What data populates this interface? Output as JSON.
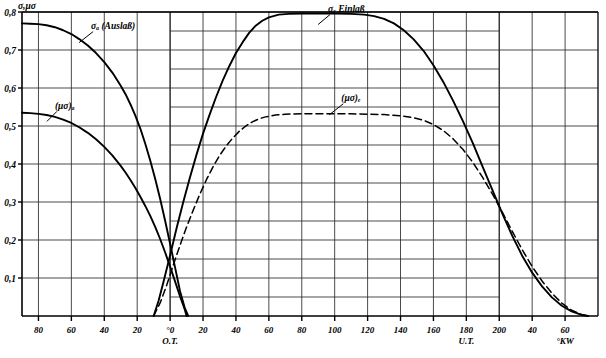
{
  "figure": {
    "y_axis_title": "σ,μσ",
    "x_unit_label": "°KW",
    "tdc_marker": "O.T.",
    "bdc_marker": "U.T."
  },
  "chart_data": {
    "type": "line",
    "title": "",
    "subtitle": "",
    "xlabel": "°KW",
    "ylabel": "σ,μσ",
    "grid": true,
    "legend_position": "inline-annotations",
    "xlim": [
      -90,
      260
    ],
    "ylim": [
      0,
      0.8
    ],
    "y_ticks": [
      0.1,
      0.2,
      0.3,
      0.4,
      0.5,
      0.6,
      0.7,
      0.8
    ],
    "y_tick_labels": [
      "0,1",
      "0,2",
      "0,3",
      "0,4",
      "0,5",
      "0,6",
      "0,7",
      "0,8"
    ],
    "x_ticks": [
      -80,
      -60,
      -40,
      -20,
      0,
      20,
      40,
      60,
      80,
      100,
      120,
      140,
      160,
      180,
      200,
      220,
      240
    ],
    "x_tick_labels": [
      "80",
      "60",
      "40",
      "20",
      "0",
      "20",
      "40",
      "60",
      "80",
      "100",
      "120",
      "140",
      "160",
      "180",
      "200",
      "40",
      "60"
    ],
    "x_tick_sublabels": {
      "0": "O.T.",
      "180": "U.T."
    },
    "annotations": [
      {
        "text": "σₐ (Auslaß)",
        "x": -48,
        "y": 0.755
      },
      {
        "text": "σₑ Einlaß",
        "x": 96,
        "y": 0.8
      },
      {
        "text": "(μσ)ₐ",
        "x": -70,
        "y": 0.545
      },
      {
        "text": "(μσ)ₑ",
        "x": 104,
        "y": 0.565
      }
    ],
    "series": [
      {
        "name": "σₐ (Auslaß)",
        "style": "solid",
        "points": [
          [
            -90,
            0.77
          ],
          [
            -85,
            0.769
          ],
          [
            -80,
            0.768
          ],
          [
            -75,
            0.765
          ],
          [
            -70,
            0.76
          ],
          [
            -65,
            0.752
          ],
          [
            -60,
            0.742
          ],
          [
            -55,
            0.728
          ],
          [
            -50,
            0.712
          ],
          [
            -45,
            0.692
          ],
          [
            -40,
            0.668
          ],
          [
            -35,
            0.64
          ],
          [
            -30,
            0.606
          ],
          [
            -27,
            0.583
          ],
          [
            -24,
            0.556
          ],
          [
            -21,
            0.526
          ],
          [
            -18,
            0.492
          ],
          [
            -15,
            0.452
          ],
          [
            -12,
            0.408
          ],
          [
            -9,
            0.36
          ],
          [
            -6,
            0.307
          ],
          [
            -3,
            0.25
          ],
          [
            0,
            0.19
          ],
          [
            3,
            0.128
          ],
          [
            6,
            0.066
          ],
          [
            9,
            0.02
          ],
          [
            11,
            0.0
          ]
        ]
      },
      {
        "name": "(μσ)ₐ",
        "style": "solid",
        "points": [
          [
            -90,
            0.535
          ],
          [
            -85,
            0.534
          ],
          [
            -80,
            0.532
          ],
          [
            -75,
            0.529
          ],
          [
            -70,
            0.524
          ],
          [
            -65,
            0.517
          ],
          [
            -60,
            0.508
          ],
          [
            -55,
            0.496
          ],
          [
            -50,
            0.482
          ],
          [
            -45,
            0.465
          ],
          [
            -40,
            0.445
          ],
          [
            -35,
            0.422
          ],
          [
            -30,
            0.395
          ],
          [
            -27,
            0.377
          ],
          [
            -24,
            0.357
          ],
          [
            -21,
            0.336
          ],
          [
            -18,
            0.313
          ],
          [
            -15,
            0.289
          ],
          [
            -12,
            0.263
          ],
          [
            -9,
            0.234
          ],
          [
            -6,
            0.202
          ],
          [
            -3,
            0.167
          ],
          [
            0,
            0.13
          ],
          [
            3,
            0.091
          ],
          [
            6,
            0.052
          ],
          [
            9,
            0.016
          ],
          [
            10,
            0.0
          ]
        ]
      },
      {
        "name": "σₑ Einlaß",
        "style": "solid",
        "points": [
          [
            -10,
            0.0
          ],
          [
            -7,
            0.04
          ],
          [
            -4,
            0.09
          ],
          [
            0,
            0.16
          ],
          [
            4,
            0.232
          ],
          [
            8,
            0.3
          ],
          [
            12,
            0.364
          ],
          [
            16,
            0.424
          ],
          [
            20,
            0.48
          ],
          [
            24,
            0.53
          ],
          [
            28,
            0.577
          ],
          [
            32,
            0.62
          ],
          [
            36,
            0.658
          ],
          [
            40,
            0.692
          ],
          [
            44,
            0.72
          ],
          [
            48,
            0.745
          ],
          [
            52,
            0.764
          ],
          [
            56,
            0.777
          ],
          [
            60,
            0.786
          ],
          [
            66,
            0.793
          ],
          [
            72,
            0.795
          ],
          [
            80,
            0.796
          ],
          [
            90,
            0.796
          ],
          [
            100,
            0.796
          ],
          [
            110,
            0.795
          ],
          [
            118,
            0.793
          ],
          [
            124,
            0.789
          ],
          [
            130,
            0.782
          ],
          [
            136,
            0.77
          ],
          [
            142,
            0.752
          ],
          [
            148,
            0.728
          ],
          [
            154,
            0.698
          ],
          [
            160,
            0.66
          ],
          [
            166,
            0.616
          ],
          [
            172,
            0.566
          ],
          [
            178,
            0.512
          ],
          [
            184,
            0.454
          ],
          [
            190,
            0.392
          ],
          [
            196,
            0.33
          ],
          [
            202,
            0.268
          ],
          [
            208,
            0.21
          ],
          [
            214,
            0.158
          ],
          [
            220,
            0.114
          ],
          [
            226,
            0.078
          ],
          [
            232,
            0.049
          ],
          [
            238,
            0.027
          ],
          [
            244,
            0.012
          ],
          [
            250,
            0.003
          ],
          [
            254,
            0.0
          ]
        ]
      },
      {
        "name": "(μσ)ₑ",
        "style": "dashed",
        "points": [
          [
            -10,
            0.0
          ],
          [
            -6,
            0.035
          ],
          [
            -2,
            0.082
          ],
          [
            2,
            0.135
          ],
          [
            6,
            0.186
          ],
          [
            10,
            0.234
          ],
          [
            14,
            0.278
          ],
          [
            18,
            0.32
          ],
          [
            22,
            0.358
          ],
          [
            26,
            0.392
          ],
          [
            30,
            0.422
          ],
          [
            34,
            0.447
          ],
          [
            38,
            0.468
          ],
          [
            42,
            0.486
          ],
          [
            46,
            0.5
          ],
          [
            50,
            0.511
          ],
          [
            54,
            0.519
          ],
          [
            58,
            0.524
          ],
          [
            64,
            0.529
          ],
          [
            70,
            0.531
          ],
          [
            80,
            0.532
          ],
          [
            90,
            0.532
          ],
          [
            100,
            0.532
          ],
          [
            110,
            0.532
          ],
          [
            120,
            0.531
          ],
          [
            130,
            0.53
          ],
          [
            140,
            0.527
          ],
          [
            148,
            0.522
          ],
          [
            154,
            0.515
          ],
          [
            160,
            0.504
          ],
          [
            166,
            0.488
          ],
          [
            172,
            0.466
          ],
          [
            178,
            0.438
          ],
          [
            184,
            0.404
          ],
          [
            190,
            0.364
          ],
          [
            196,
            0.32
          ],
          [
            202,
            0.272
          ],
          [
            208,
            0.222
          ],
          [
            214,
            0.174
          ],
          [
            220,
            0.13
          ],
          [
            226,
            0.092
          ],
          [
            232,
            0.06
          ],
          [
            238,
            0.034
          ],
          [
            244,
            0.015
          ],
          [
            250,
            0.004
          ],
          [
            254,
            0.0
          ]
        ]
      }
    ],
    "dense_grid_region": {
      "x_start": 0,
      "x_end": 200,
      "half_step_y": true
    }
  }
}
